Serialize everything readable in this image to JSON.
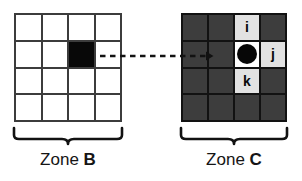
{
  "figure": {
    "colors": {
      "page_background": "#ffffff",
      "grid_b_line": "#3c3c3c",
      "grid_b_cell": "#ffffff",
      "grid_b_filled_cell": "#080808",
      "grid_c_line": "#121212",
      "grid_c_cell": "#3d3d3d",
      "grid_c_label_cell": "#e2e2e2",
      "grid_c_marker_cell": "#ffffff",
      "marker_dot": "#070707",
      "text": "#151515",
      "connector": "#121212"
    }
  },
  "zone_b": {
    "caption_word": "Zone",
    "caption_letter": "B",
    "rows": 4,
    "cols": 4,
    "cells": [
      [
        {
          "state": "empty-light",
          "label": ""
        },
        {
          "state": "empty-light",
          "label": ""
        },
        {
          "state": "empty-light",
          "label": ""
        },
        {
          "state": "empty-light",
          "label": ""
        }
      ],
      [
        {
          "state": "empty-light",
          "label": ""
        },
        {
          "state": "empty-light",
          "label": ""
        },
        {
          "state": "filled-black",
          "label": ""
        },
        {
          "state": "empty-light",
          "label": ""
        }
      ],
      [
        {
          "state": "empty-light",
          "label": ""
        },
        {
          "state": "empty-light",
          "label": ""
        },
        {
          "state": "empty-light",
          "label": ""
        },
        {
          "state": "empty-light",
          "label": ""
        }
      ],
      [
        {
          "state": "empty-light",
          "label": ""
        },
        {
          "state": "empty-light",
          "label": ""
        },
        {
          "state": "empty-light",
          "label": ""
        },
        {
          "state": "empty-light",
          "label": ""
        }
      ]
    ]
  },
  "zone_c": {
    "caption_word": "Zone",
    "caption_letter": "C",
    "rows": 4,
    "cols": 4,
    "cells": [
      [
        {
          "state": "empty-dark",
          "label": ""
        },
        {
          "state": "empty-dark",
          "label": ""
        },
        {
          "state": "label-light",
          "label": "i"
        },
        {
          "state": "empty-dark",
          "label": ""
        }
      ],
      [
        {
          "state": "empty-dark",
          "label": ""
        },
        {
          "state": "empty-dark",
          "label": ""
        },
        {
          "state": "marker-cell",
          "label": ""
        },
        {
          "state": "label-light",
          "label": "j"
        }
      ],
      [
        {
          "state": "empty-dark",
          "label": ""
        },
        {
          "state": "empty-dark",
          "label": ""
        },
        {
          "state": "label-light",
          "label": "k"
        },
        {
          "state": "empty-dark",
          "label": ""
        }
      ],
      [
        {
          "state": "empty-dark",
          "label": ""
        },
        {
          "state": "empty-dark",
          "label": ""
        },
        {
          "state": "empty-dark",
          "label": ""
        },
        {
          "state": "empty-dark",
          "label": ""
        }
      ]
    ]
  },
  "connector": {
    "style": "dashed-arrow",
    "direction": "left-to-right",
    "from": "zone-b-filled-cell",
    "to": "zone-c-marker-cell"
  }
}
